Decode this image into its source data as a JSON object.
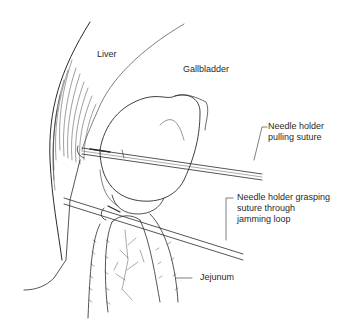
{
  "figure": {
    "type": "surgical-illustration",
    "labels": {
      "liver": "Liver",
      "gallbladder": "Gallbladder",
      "needle_holder_pulling": [
        "Needle holder",
        "pulling suture"
      ],
      "needle_holder_grasping": [
        "Needle holder grasping",
        "suture through",
        "jamming loop"
      ],
      "jejunum": "Jejunum"
    },
    "colors": {
      "line": "#2a2a2a",
      "background": "#ffffff"
    }
  }
}
